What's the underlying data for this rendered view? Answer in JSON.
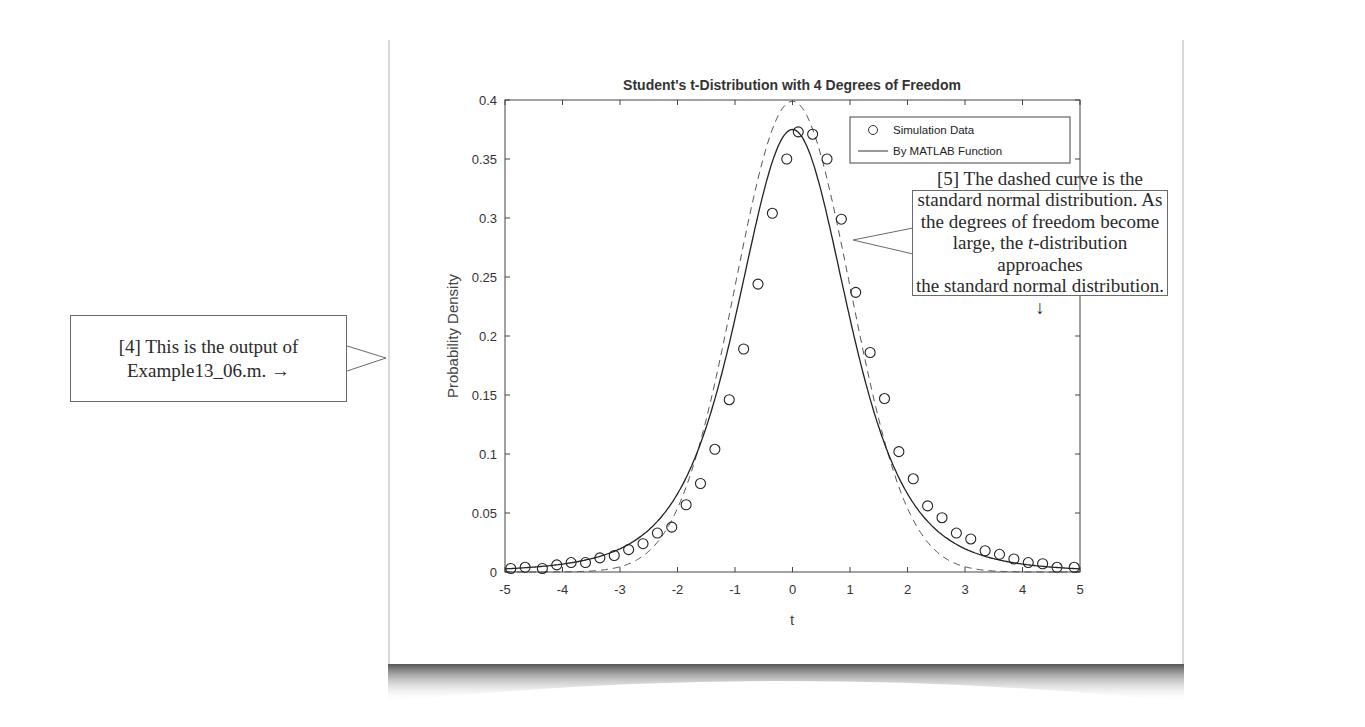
{
  "figure": {
    "title": "Student's t-Distribution with 4 Degrees of Freedom",
    "xlabel": "t",
    "ylabel": "Probability Density",
    "x_ticks": [
      "-5",
      "-4",
      "-3",
      "-2",
      "-1",
      "0",
      "1",
      "2",
      "3",
      "4",
      "5"
    ],
    "y_ticks": [
      "0",
      "0.05",
      "0.1",
      "0.15",
      "0.2",
      "0.25",
      "0.3",
      "0.35",
      "0.4"
    ],
    "legend": {
      "items": [
        {
          "label": "Simulation Data",
          "marker": "circle"
        },
        {
          "label": "By MATLAB Function",
          "marker": "line"
        }
      ]
    }
  },
  "callouts": {
    "left": {
      "line1": "[4] This is the output of",
      "line2": "Example13_06.m. →"
    },
    "right": {
      "line1": "[5] The dashed curve is the",
      "line2": "standard normal distribution.  As",
      "line3": "the degrees of freedom become",
      "line4_a": "large, the ",
      "line4_b": "t",
      "line4_c": "-distribution approaches",
      "line5": "the standard normal distribution. ↓"
    }
  },
  "chart_data": {
    "type": "line",
    "title": "Student's t-Distribution with 4 Degrees of Freedom",
    "xlabel": "t",
    "ylabel": "Probability Density",
    "xlim": [
      -5,
      5
    ],
    "ylim": [
      0,
      0.4
    ],
    "grid": false,
    "legend_position": "upper right",
    "series": [
      {
        "name": "Simulation Data",
        "style": "circle markers",
        "x": [
          -4.9,
          -4.65,
          -4.35,
          -4.1,
          -3.85,
          -3.6,
          -3.35,
          -3.1,
          -2.85,
          -2.6,
          -2.35,
          -2.1,
          -1.85,
          -1.6,
          -1.35,
          -1.1,
          -0.85,
          -0.6,
          -0.35,
          -0.1,
          0.1,
          0.35,
          0.6,
          0.85,
          1.1,
          1.35,
          1.6,
          1.85,
          2.1,
          2.35,
          2.6,
          2.85,
          3.1,
          3.35,
          3.6,
          3.85,
          4.1,
          4.35,
          4.6,
          4.9
        ],
        "y": [
          0.003,
          0.004,
          0.003,
          0.006,
          0.008,
          0.008,
          0.012,
          0.014,
          0.019,
          0.024,
          0.033,
          0.038,
          0.057,
          0.075,
          0.104,
          0.146,
          0.189,
          0.244,
          0.304,
          0.35,
          0.373,
          0.371,
          0.35,
          0.299,
          0.237,
          0.186,
          0.147,
          0.102,
          0.079,
          0.056,
          0.046,
          0.033,
          0.028,
          0.018,
          0.015,
          0.011,
          0.008,
          0.007,
          0.004,
          0.004
        ]
      },
      {
        "name": "By MATLAB Function",
        "style": "solid line",
        "x": [
          -5,
          -4,
          -3,
          -2.5,
          -2,
          -1.5,
          -1,
          -0.5,
          0,
          0.5,
          1,
          1.5,
          2,
          2.5,
          3,
          4,
          5
        ],
        "y": [
          0.0042,
          0.0067,
          0.0197,
          0.0367,
          0.0661,
          0.1152,
          0.2147,
          0.3217,
          0.375,
          0.3217,
          0.2147,
          0.1152,
          0.0661,
          0.0367,
          0.0197,
          0.0067,
          0.0042
        ]
      },
      {
        "name": "Standard Normal (dashed)",
        "style": "dashed line",
        "x": [
          -5,
          -4,
          -3,
          -2.5,
          -2,
          -1.5,
          -1,
          -0.5,
          0,
          0.5,
          1,
          1.5,
          2,
          2.5,
          3,
          4,
          5
        ],
        "y": [
          1.5e-06,
          0.0001,
          0.0044,
          0.0175,
          0.054,
          0.1295,
          0.242,
          0.3521,
          0.3989,
          0.3521,
          0.242,
          0.1295,
          0.054,
          0.0175,
          0.0044,
          0.0001,
          1.5e-06
        ]
      }
    ]
  }
}
